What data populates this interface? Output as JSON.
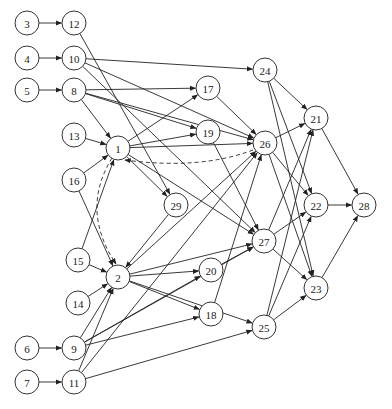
{
  "diagram": {
    "type": "directed-graph",
    "node_radius": 12,
    "nodes": [
      {
        "id": "3",
        "x": 27,
        "y": 23
      },
      {
        "id": "12",
        "x": 74,
        "y": 23
      },
      {
        "id": "4",
        "x": 27,
        "y": 58
      },
      {
        "id": "10",
        "x": 74,
        "y": 58
      },
      {
        "id": "5",
        "x": 27,
        "y": 90
      },
      {
        "id": "8",
        "x": 74,
        "y": 90
      },
      {
        "id": "13",
        "x": 74,
        "y": 135
      },
      {
        "id": "1",
        "x": 118,
        "y": 148
      },
      {
        "id": "16",
        "x": 74,
        "y": 180
      },
      {
        "id": "29",
        "x": 176,
        "y": 205
      },
      {
        "id": "15",
        "x": 78,
        "y": 260
      },
      {
        "id": "2",
        "x": 118,
        "y": 277
      },
      {
        "id": "14",
        "x": 78,
        "y": 303
      },
      {
        "id": "6",
        "x": 27,
        "y": 348
      },
      {
        "id": "9",
        "x": 74,
        "y": 348
      },
      {
        "id": "7",
        "x": 27,
        "y": 382
      },
      {
        "id": "11",
        "x": 74,
        "y": 382
      },
      {
        "id": "17",
        "x": 208,
        "y": 88
      },
      {
        "id": "19",
        "x": 208,
        "y": 132
      },
      {
        "id": "24",
        "x": 265,
        "y": 70
      },
      {
        "id": "26",
        "x": 265,
        "y": 143
      },
      {
        "id": "21",
        "x": 316,
        "y": 118
      },
      {
        "id": "20",
        "x": 211,
        "y": 270
      },
      {
        "id": "27",
        "x": 264,
        "y": 241
      },
      {
        "id": "18",
        "x": 211,
        "y": 314
      },
      {
        "id": "25",
        "x": 264,
        "y": 327
      },
      {
        "id": "22",
        "x": 316,
        "y": 205
      },
      {
        "id": "23",
        "x": 316,
        "y": 288
      },
      {
        "id": "28",
        "x": 364,
        "y": 205
      }
    ],
    "edges": [
      [
        "3",
        "12"
      ],
      [
        "4",
        "10"
      ],
      [
        "5",
        "8"
      ],
      [
        "6",
        "9"
      ],
      [
        "7",
        "11"
      ],
      [
        "12",
        "29"
      ],
      [
        "10",
        "24"
      ],
      [
        "10",
        "26"
      ],
      [
        "10",
        "27"
      ],
      [
        "8",
        "1"
      ],
      [
        "8",
        "17"
      ],
      [
        "8",
        "26"
      ],
      [
        "8",
        "19"
      ],
      [
        "13",
        "1"
      ],
      [
        "16",
        "1"
      ],
      [
        "16",
        "2"
      ],
      [
        "15",
        "1"
      ],
      [
        "15",
        "2"
      ],
      [
        "14",
        "2"
      ],
      [
        "1",
        "17"
      ],
      [
        "1",
        "19"
      ],
      [
        "1",
        "26"
      ],
      [
        "1",
        "29"
      ],
      [
        "1",
        "27"
      ],
      [
        "29",
        "2"
      ],
      [
        "2",
        "27"
      ],
      [
        "2",
        "20"
      ],
      [
        "2",
        "18"
      ],
      [
        "2",
        "25"
      ],
      [
        "2",
        "26"
      ],
      [
        "9",
        "2"
      ],
      [
        "9",
        "20"
      ],
      [
        "9",
        "27"
      ],
      [
        "9",
        "18"
      ],
      [
        "11",
        "2"
      ],
      [
        "11",
        "26"
      ],
      [
        "11",
        "25"
      ],
      [
        "17",
        "26"
      ],
      [
        "19",
        "27"
      ],
      [
        "24",
        "21"
      ],
      [
        "24",
        "22"
      ],
      [
        "24",
        "23"
      ],
      [
        "26",
        "21"
      ],
      [
        "26",
        "22"
      ],
      [
        "26",
        "23"
      ],
      [
        "20",
        "27"
      ],
      [
        "18",
        "26"
      ],
      [
        "27",
        "21"
      ],
      [
        "27",
        "22"
      ],
      [
        "27",
        "23"
      ],
      [
        "25",
        "21"
      ],
      [
        "25",
        "22"
      ],
      [
        "25",
        "23"
      ],
      [
        "21",
        "28"
      ],
      [
        "22",
        "28"
      ],
      [
        "23",
        "28"
      ]
    ],
    "dashed_edges": [
      {
        "from": "26",
        "to": "1",
        "curve": "M253,150 Q200,170 125,160"
      },
      {
        "from": "1",
        "to": "2",
        "curve": "M112,158 Q80,210 116,264"
      }
    ],
    "colors": {
      "stroke": "#222222",
      "node_fill": "#ffffff"
    }
  },
  "caption": ""
}
